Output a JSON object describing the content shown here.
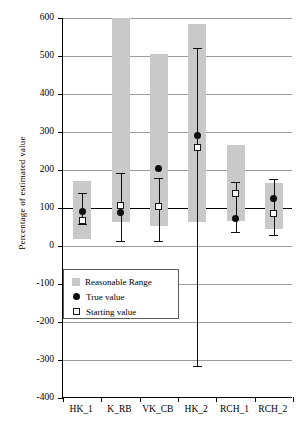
{
  "chart_data": {
    "type": "bar",
    "title": "",
    "xlabel": "",
    "ylabel": "Percentage of estimated value",
    "categories": [
      "HK_1",
      "K_RB",
      "VK_CB",
      "HK_2",
      "RCH_1",
      "RCH_2"
    ],
    "ylim": [
      -400,
      600
    ],
    "yticks": [
      600,
      500,
      400,
      300,
      200,
      100,
      0,
      -100,
      -200,
      -300,
      -400
    ],
    "ytick_labels": [
      "600",
      "500",
      "400",
      "300",
      "200",
      "100",
      "0",
      "-100",
      "-200",
      "-300",
      "-400"
    ],
    "grid": true,
    "reference_line": 100,
    "legend_position": "lower-left-inside",
    "legend": [
      {
        "key": "reasonable-range",
        "label": "Reasonable Range",
        "marker": "square-filled-gray",
        "color": "#c9c9c9"
      },
      {
        "key": "true-value",
        "label": "True value",
        "marker": "circle-filled-black",
        "color": "#0d0d0d"
      },
      {
        "key": "starting-value",
        "label": "Starting value",
        "marker": "square-open",
        "color": "#ffffff"
      }
    ],
    "series": [
      {
        "name": "Reasonable Range",
        "type": "range-band",
        "values": [
          {
            "category": "HK_1",
            "low": 18,
            "high": 172
          },
          {
            "category": "K_RB",
            "low": 64,
            "high": 620
          },
          {
            "category": "VK_CB",
            "low": 52,
            "high": 505
          },
          {
            "category": "HK_2",
            "low": 64,
            "high": 585
          },
          {
            "category": "RCH_1",
            "low": 65,
            "high": 265
          },
          {
            "category": "RCH_2",
            "low": 45,
            "high": 165
          }
        ]
      },
      {
        "name": "Estimate range (error bars)",
        "type": "errorbar",
        "values": [
          {
            "category": "HK_1",
            "low": 58,
            "high": 140
          },
          {
            "category": "K_RB",
            "low": 12,
            "high": 191
          },
          {
            "category": "VK_CB",
            "low": 14,
            "high": 178
          },
          {
            "category": "HK_2",
            "low": -315,
            "high": 520
          },
          {
            "category": "RCH_1",
            "low": 38,
            "high": 168
          },
          {
            "category": "RCH_2",
            "low": 30,
            "high": 176
          }
        ]
      },
      {
        "name": "True value",
        "type": "point",
        "values": [
          {
            "category": "HK_1",
            "value": 90
          },
          {
            "category": "K_RB",
            "value": 89
          },
          {
            "category": "VK_CB",
            "value": 205
          },
          {
            "category": "HK_2",
            "value": 290
          },
          {
            "category": "RCH_1",
            "value": 72
          },
          {
            "category": "RCH_2",
            "value": 125
          }
        ]
      },
      {
        "name": "Starting value",
        "type": "point",
        "values": [
          {
            "category": "HK_1",
            "value": 68
          },
          {
            "category": "K_RB",
            "value": 106
          },
          {
            "category": "VK_CB",
            "value": 104
          },
          {
            "category": "HK_2",
            "value": 260
          },
          {
            "category": "RCH_1",
            "value": 137
          },
          {
            "category": "RCH_2",
            "value": 85
          }
        ]
      }
    ]
  }
}
